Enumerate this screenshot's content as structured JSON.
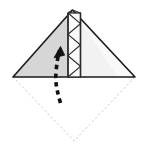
{
  "diagram": {
    "canvas": {
      "width": 145,
      "height": 153,
      "background": "#ffffff"
    },
    "colors": {
      "outline": "#1a1a1a",
      "left_face_fill": "#d6d6d6",
      "right_face_fill": "#f2f2f2",
      "band_fill": "#fbfbfb",
      "band_line": "#2b2b2b",
      "ghost_line": "#c9c9c9",
      "arrow": "#111111"
    },
    "shapes": {
      "triangle": {
        "name": "folded-triangle",
        "apex": {
          "x": 72.5,
          "y": 10
        },
        "left_vertex": {
          "x": 13,
          "y": 77
        },
        "right_vertex": {
          "x": 135,
          "y": 77
        },
        "stroke_width": 1.6
      },
      "left_face": {
        "name": "left-face",
        "fill": "#d6d6d6",
        "points": "72.5,10 13,77 72.5,77"
      },
      "right_face": {
        "name": "right-face",
        "fill": "#f2f2f2",
        "points": "72.5,10 135,77 72.5,77"
      },
      "pleat_band": {
        "name": "pleat-band",
        "x": 68,
        "y": 13,
        "width": 12.5,
        "height": 64,
        "fill": "#fbfbfb",
        "zigzag_segments": 6
      },
      "ghost_diamond": {
        "name": "ghost-square-outline",
        "points": "13,77 74,141 135,77",
        "stroke": "#c9c9c9",
        "dash": "1.4 3.2",
        "stroke_width": 1
      },
      "fold_arrow": {
        "name": "fold-arrow",
        "path": "M 60.5,103 C 57.5,92 55,84 56,72 C 56.8,63 58,56 59.5,50.5",
        "dash": "4.5 4",
        "stroke_width": 3.6,
        "head": {
          "tip_x": 60.5,
          "tip_y": 46.5,
          "size": 9
        },
        "direction": "upward"
      }
    },
    "labels": {
      "step_caption": "",
      "alt_text": "Square folded to a triangle with a narrow pleated strip in the middle and a curved dashed arrow showing the next upward fold"
    }
  }
}
